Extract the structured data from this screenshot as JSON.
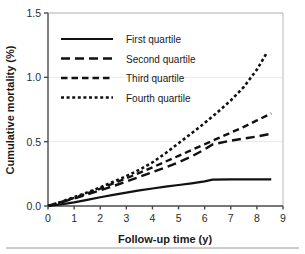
{
  "chart_data": {
    "type": "line",
    "title": "",
    "xlabel": "Follow-up time (y)",
    "ylabel": "Cumulative mortality (%)",
    "xlim": [
      0,
      9
    ],
    "ylim": [
      0.0,
      1.5
    ],
    "xticks": [
      "0",
      "1",
      "2",
      "3",
      "4",
      "5",
      "6",
      "7",
      "8",
      "9"
    ],
    "xtick_values": [
      0,
      1,
      2,
      3,
      4,
      5,
      6,
      7,
      8,
      9
    ],
    "yticks": [
      "0.0",
      "0.5",
      "1.0",
      "1.5"
    ],
    "ytick_values": [
      0.0,
      0.5,
      1.0,
      1.5
    ],
    "grid": "horizontal",
    "legend_position": "upper-left",
    "series": [
      {
        "name": "First quartile",
        "dash": "solid",
        "dasharray": "none",
        "width": 2.2,
        "x": [
          0.0,
          0.5,
          1.0,
          1.5,
          2.0,
          2.5,
          3.0,
          3.5,
          4.0,
          4.5,
          5.0,
          5.5,
          6.0,
          6.3,
          7.0,
          7.5,
          8.0,
          8.55
        ],
        "values": [
          0.0,
          0.012,
          0.028,
          0.048,
          0.068,
          0.086,
          0.104,
          0.121,
          0.136,
          0.15,
          0.163,
          0.176,
          0.191,
          0.205,
          0.207,
          0.207,
          0.207,
          0.207
        ]
      },
      {
        "name": "Second quartile",
        "dash": "long-dash",
        "dasharray": "9,5",
        "width": 2.4,
        "x": [
          0.0,
          0.5,
          1.0,
          1.5,
          2.0,
          2.5,
          3.0,
          3.5,
          4.0,
          4.5,
          5.0,
          5.5,
          6.0,
          6.3,
          7.0,
          7.5,
          8.0,
          8.55
        ],
        "values": [
          0.0,
          0.028,
          0.058,
          0.09,
          0.122,
          0.155,
          0.19,
          0.226,
          0.263,
          0.3,
          0.34,
          0.385,
          0.44,
          0.478,
          0.508,
          0.524,
          0.54,
          0.562
        ]
      },
      {
        "name": "Third quartile",
        "dash": "medium-dash",
        "dasharray": "6.5,4",
        "width": 2.4,
        "x": [
          0.0,
          0.5,
          1.0,
          1.5,
          2.0,
          2.5,
          3.0,
          3.5,
          4.0,
          4.5,
          5.0,
          5.5,
          6.0,
          6.5,
          7.0,
          7.5,
          8.0,
          8.55
        ],
        "values": [
          0.0,
          0.03,
          0.063,
          0.098,
          0.135,
          0.175,
          0.215,
          0.257,
          0.3,
          0.345,
          0.39,
          0.435,
          0.48,
          0.525,
          0.57,
          0.615,
          0.665,
          0.72
        ]
      },
      {
        "name": "Fourth quartile",
        "dash": "dotted",
        "dasharray": "3,2.6",
        "width": 2.6,
        "x": [
          0.0,
          0.5,
          1.0,
          1.5,
          2.0,
          2.5,
          3.0,
          3.5,
          4.0,
          4.5,
          5.0,
          5.5,
          6.0,
          6.5,
          7.0,
          7.5,
          8.0,
          8.35
        ],
        "values": [
          0.0,
          0.032,
          0.068,
          0.105,
          0.145,
          0.188,
          0.232,
          0.282,
          0.338,
          0.41,
          0.488,
          0.565,
          0.645,
          0.73,
          0.82,
          0.925,
          1.06,
          1.18
        ]
      }
    ]
  },
  "colors": {
    "series": "#111111",
    "grid": "#e8e8e8",
    "axis": "#4a4a4a",
    "text": "#1a1a1a",
    "background": "#ffffff"
  }
}
